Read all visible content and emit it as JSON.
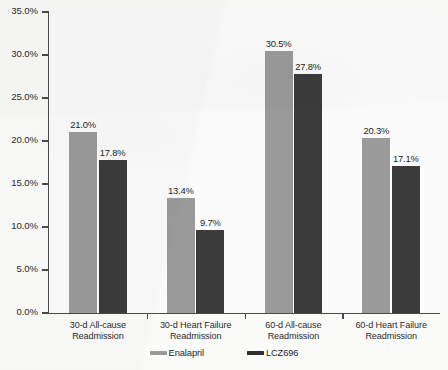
{
  "chart_data": {
    "type": "bar",
    "title": "",
    "subtitle": "",
    "xlabel": "",
    "ylabel": "",
    "ylim": [
      0,
      35
    ],
    "grid": false,
    "legend_position": "bottom-center",
    "y_ticks": [
      "0.0%",
      "5.0%",
      "10.0%",
      "15.0%",
      "20.0%",
      "25.0%",
      "30.0%",
      "35.0%"
    ],
    "y_tick_values": [
      0,
      5,
      10,
      15,
      20,
      25,
      30,
      35
    ],
    "categories": [
      "30-d All-cause Readmission",
      "30-d Heart Failure Readmission",
      "60-d All-cause Readmission",
      "60-d Heart Failure Readmission"
    ],
    "category_lines": [
      [
        "30-d All-cause",
        "Readmission"
      ],
      [
        "30-d Heart Failure",
        "Readmission"
      ],
      [
        "60-d All-cause",
        "Readmission"
      ],
      [
        "60-d Heart Failure",
        "Readmission"
      ]
    ],
    "series": [
      {
        "name": "Enalapril",
        "color": "#9a9a9a",
        "values": [
          21.0,
          13.4,
          30.5,
          20.3
        ],
        "labels": [
          "21.0%",
          "13.4%",
          "30.5%",
          "20.3%"
        ]
      },
      {
        "name": "LCZ696",
        "color": "#3b3b3b",
        "values": [
          17.8,
          9.7,
          27.8,
          17.1
        ],
        "labels": [
          "17.8%",
          "9.7%",
          "27.8%",
          "17.1%"
        ]
      }
    ]
  }
}
